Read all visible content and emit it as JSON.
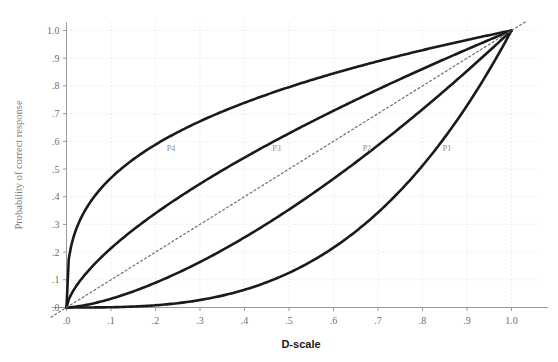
{
  "chart_data": {
    "type": "line",
    "title": "",
    "xlabel": "D-scale",
    "ylabel": "Probability of correct response",
    "xlim": [
      0.0,
      1.0
    ],
    "ylim": [
      0.0,
      1.0
    ],
    "grid": true,
    "legend_position": "inline-annotations",
    "x_ticks": [
      ".0",
      ".1",
      ".2",
      ".3",
      ".4",
      ".5",
      ".6",
      ".7",
      ".8",
      ".9",
      "1.0"
    ],
    "x_tick_values": [
      0.0,
      0.1,
      0.2,
      0.3,
      0.4,
      0.5,
      0.6,
      0.7,
      0.8,
      0.9,
      1.0
    ],
    "y_ticks": [
      ".0",
      ".1",
      ".2",
      ".3",
      ".4",
      ".5",
      ".6",
      ".7",
      ".8",
      ".9",
      "1.0"
    ],
    "y_tick_values": [
      0.0,
      0.1,
      0.2,
      0.3,
      0.4,
      0.5,
      0.6,
      0.7,
      0.8,
      0.9,
      1.0
    ],
    "x": [
      0.0,
      0.05,
      0.1,
      0.15,
      0.2,
      0.25,
      0.3,
      0.35,
      0.4,
      0.45,
      0.5,
      0.55,
      0.6,
      0.65,
      0.7,
      0.75,
      0.8,
      0.85,
      0.9,
      0.95,
      1.0
    ],
    "series": [
      {
        "name": "P4",
        "label": "P4",
        "color": "#1a1a1a",
        "style": "solid",
        "exponent": 0.33,
        "label_x": 0.235,
        "label_y": 0.565,
        "values": [
          0.0,
          0.371,
          0.467,
          0.533,
          0.587,
          0.632,
          0.671,
          0.706,
          0.738,
          0.767,
          0.795,
          0.82,
          0.844,
          0.867,
          0.889,
          0.91,
          0.929,
          0.948,
          0.966,
          0.984,
          1.0
        ]
      },
      {
        "name": "P3",
        "label": "P3",
        "color": "#1a1a1a",
        "style": "solid",
        "exponent": 0.67,
        "label_x": 0.472,
        "label_y": 0.565,
        "values": [
          0.0,
          0.137,
          0.218,
          0.283,
          0.341,
          0.394,
          0.444,
          0.491,
          0.536,
          0.579,
          0.628,
          0.663,
          0.702,
          0.74,
          0.778,
          0.815,
          0.851,
          0.887,
          0.922,
          0.957,
          1.0
        ]
      },
      {
        "name": "P2",
        "label": "P2",
        "color": "#1a1a1a",
        "style": "solid",
        "exponent": 1.5,
        "label_x": 0.675,
        "label_y": 0.565,
        "values": [
          0.0,
          0.011,
          0.032,
          0.058,
          0.089,
          0.125,
          0.164,
          0.207,
          0.253,
          0.302,
          0.354,
          0.408,
          0.465,
          0.524,
          0.586,
          0.65,
          0.716,
          0.784,
          0.854,
          0.926,
          1.0
        ]
      },
      {
        "name": "P1",
        "label": "P1",
        "color": "#1a1a1a",
        "style": "solid",
        "exponent": 3.0,
        "label_x": 0.855,
        "label_y": 0.565,
        "values": [
          0.0,
          0.0,
          0.001,
          0.003,
          0.008,
          0.016,
          0.027,
          0.043,
          0.064,
          0.091,
          0.125,
          0.166,
          0.216,
          0.275,
          0.343,
          0.422,
          0.512,
          0.614,
          0.729,
          0.857,
          1.0
        ]
      },
      {
        "name": "identity",
        "label": "",
        "color": "#6f6f6f",
        "style": "dashed",
        "exponent": 1.0,
        "label_x": null,
        "label_y": null,
        "values": [
          0.0,
          0.05,
          0.1,
          0.15,
          0.2,
          0.25,
          0.3,
          0.35,
          0.4,
          0.45,
          0.5,
          0.55,
          0.6,
          0.65,
          0.7,
          0.75,
          0.8,
          0.85,
          0.9,
          0.95,
          1.0
        ]
      }
    ]
  },
  "colors": {
    "curve": "#1a1a1a",
    "grid": "#dedede",
    "axis": "#9a9a9a",
    "tick_text": "#6d6d6d",
    "xlabel_text": "#1a1a1a",
    "ylabel_text": "#7a7a7a",
    "annotation_text": "#8a8a8a",
    "background": "#ffffff"
  }
}
